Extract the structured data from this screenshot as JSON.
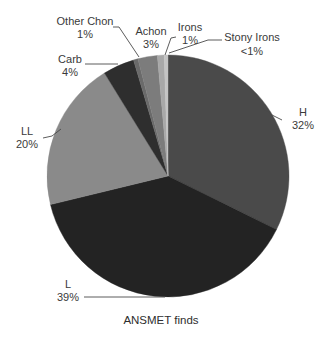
{
  "chart_data": {
    "type": "pie",
    "title": "",
    "caption": "ANSMET finds",
    "start_angle_deg": 0,
    "direction": "clockwise",
    "slices": [
      {
        "name": "H",
        "label": "H",
        "pct_label": "32%",
        "value": 32.3,
        "color": "#4a4a4a"
      },
      {
        "name": "L",
        "label": "L",
        "pct_label": "39%",
        "value": 38.9,
        "color": "#232323"
      },
      {
        "name": "LL",
        "label": "LL",
        "pct_label": "20%",
        "value": 20.0,
        "color": "#8a8a8a"
      },
      {
        "name": "Carb",
        "label": "Carb",
        "pct_label": "4%",
        "value": 4.2,
        "color": "#2e2e2e"
      },
      {
        "name": "Other Chon",
        "label": "Other Chon",
        "pct_label": "1%",
        "value": 0.6,
        "color": "#6a6a6a"
      },
      {
        "name": "Achon",
        "label": "Achon",
        "pct_label": "3%",
        "value": 2.6,
        "color": "#7c7c7c"
      },
      {
        "name": "Irons",
        "label": "Irons",
        "pct_label": "1%",
        "value": 0.9,
        "color": "#a8a8a8"
      },
      {
        "name": "Stony Irons",
        "label": "Stony Irons",
        "pct_label": "<1%",
        "value": 0.5,
        "color": "#c4c4c4"
      }
    ],
    "legend": "none (direct labels with leader lines)"
  },
  "layout": {
    "cx": 168,
    "cy": 176,
    "r": 121,
    "labels": [
      {
        "slice": "H",
        "x": 303,
        "y1": 116,
        "y2": 129,
        "anchor": "middle",
        "line": [
          [
            282,
            120
          ],
          [
            272,
            115
          ],
          [
            262,
            108
          ]
        ]
      },
      {
        "slice": "L",
        "x": 68,
        "y1": 288,
        "y2": 301,
        "anchor": "middle",
        "line": [
          [
            84,
            297
          ],
          [
            165,
            297
          ]
        ]
      },
      {
        "slice": "LL",
        "x": 27,
        "y1": 135,
        "y2": 148,
        "anchor": "middle",
        "line": [
          [
            43,
            138
          ],
          [
            52,
            136
          ],
          [
            61,
            129
          ]
        ]
      },
      {
        "slice": "Carb",
        "x": 70,
        "y1": 63,
        "y2": 76,
        "anchor": "middle",
        "line": [
          [
            85,
            64
          ],
          [
            118,
            64
          ]
        ]
      },
      {
        "slice": "Other Chon",
        "x": 85,
        "y1": 25,
        "y2": 38,
        "anchor": "middle",
        "line": [
          [
            113,
            27
          ],
          [
            119,
            27
          ],
          [
            139,
            57
          ]
        ]
      },
      {
        "slice": "Achon",
        "x": 151,
        "y1": 35,
        "y2": 48,
        "anchor": "middle",
        "line": []
      },
      {
        "slice": "Irons",
        "x": 190,
        "y1": 31,
        "y2": 44,
        "anchor": "middle",
        "line": [
          [
            176,
            37
          ],
          [
            171,
            38
          ],
          [
            165,
            55
          ]
        ]
      },
      {
        "slice": "Stony Irons",
        "x": 252,
        "y1": 41,
        "y2": 55,
        "anchor": "middle",
        "line": [
          [
            222,
            40
          ],
          [
            208,
            40
          ],
          [
            169,
            53
          ]
        ]
      }
    ],
    "caption": {
      "x": 161,
      "y": 324
    }
  }
}
